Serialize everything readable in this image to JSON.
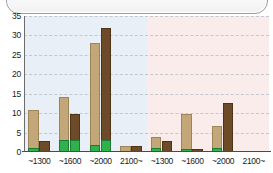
{
  "chart_data": {
    "type": "bar",
    "title": "",
    "subtitle": "",
    "xlabel": "",
    "ylabel": "",
    "ylim": [
      0,
      35
    ],
    "yticks": [
      0,
      5,
      10,
      15,
      20,
      25,
      30,
      35
    ],
    "grid": true,
    "legend": "none",
    "stacked": true,
    "panels": [
      {
        "name": "left-panel",
        "background": "#e8eff7",
        "categories": [
          "~1300",
          "~1600",
          "~2000",
          "2100~"
        ],
        "series": [
          {
            "name": "series-tan",
            "color": "#c3a778",
            "values": [
              10.5,
              13.8,
              27.7,
              1.4
            ]
          },
          {
            "name": "series-brown",
            "color": "#6d4a28",
            "values": [
              2.5,
              9.6,
              31.6,
              1.4
            ]
          }
        ],
        "green_base": [
          {
            "name": "green-in-tan",
            "color": "#2fb14b",
            "values": [
              0.7,
              2.9,
              1.6,
              0.0
            ]
          },
          {
            "name": "green-in-brown",
            "color": "#2fb14b",
            "values": [
              0.0,
              2.9,
              2.9,
              0.0
            ]
          }
        ]
      },
      {
        "name": "right-panel",
        "background": "#fbecec",
        "categories": [
          "~1300",
          "~1600",
          "~2000",
          "2100~"
        ],
        "series": [
          {
            "name": "series-tan",
            "color": "#c3a778",
            "values": [
              3.6,
              9.5,
              6.4,
              0.0
            ]
          },
          {
            "name": "series-brown",
            "color": "#6d4a28",
            "values": [
              2.5,
              0.5,
              12.4,
              0.0
            ]
          }
        ],
        "green_base": [
          {
            "name": "green-in-tan",
            "color": "#2fb14b",
            "values": [
              0.8,
              0.6,
              0.8,
              0.0
            ]
          },
          {
            "name": "green-in-brown",
            "color": "#2fb14b",
            "values": [
              0.0,
              0.0,
              0.0,
              0.0
            ]
          }
        ]
      }
    ],
    "xticks": [
      "~1300",
      "~1600",
      "~2000",
      "2100~",
      "~1300",
      "~1600",
      "~2000",
      "2100~"
    ]
  }
}
